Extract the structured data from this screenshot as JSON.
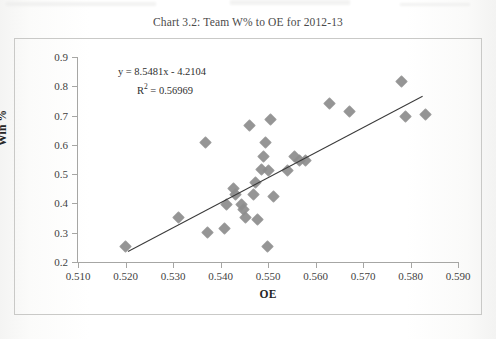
{
  "title": "Chart 3.2:  Team W% to OE for 2012-13",
  "annotation": {
    "equation": "y = 8.5481x - 4.2104",
    "r_squared_prefix": "R",
    "r_squared_exp": "2",
    "r_squared_value": " = 0.56969"
  },
  "colors": {
    "marker": "#8d8d8d",
    "trendline": "#3a3a3a",
    "axis": "#a6a6a4",
    "frame": "#c9c9c7",
    "text": "#3f3f3f"
  },
  "chart_data": {
    "type": "scatter",
    "title": "Chart 3.2:  Team W% to OE for 2012-13",
    "xlabel": "OE",
    "ylabel": "Win %",
    "xlim": [
      0.51,
      0.59
    ],
    "ylim": [
      0.2,
      0.9
    ],
    "xticks": [
      "0.510",
      "0.520",
      "0.530",
      "0.540",
      "0.550",
      "0.560",
      "0.570",
      "0.580",
      "0.590"
    ],
    "yticks": [
      "0.2",
      "0.3",
      "0.4",
      "0.5",
      "0.6",
      "0.7",
      "0.8",
      "0.9"
    ],
    "xtick_values": [
      0.51,
      0.52,
      0.53,
      0.54,
      0.55,
      0.56,
      0.57,
      0.58,
      0.59
    ],
    "ytick_values": [
      0.2,
      0.3,
      0.4,
      0.5,
      0.6,
      0.7,
      0.8,
      0.9
    ],
    "grid": false,
    "legend": false,
    "marker": "diamond",
    "annotations": [
      "y = 8.5481x - 4.2104",
      "R2 = 0.56969"
    ],
    "trendline": {
      "type": "linear",
      "slope": 8.5481,
      "intercept": -4.2104,
      "r_squared": 0.56969,
      "x_start": 0.5205,
      "x_end": 0.5825
    },
    "points": [
      {
        "x": 0.52,
        "y": 0.253
      },
      {
        "x": 0.5312,
        "y": 0.353
      },
      {
        "x": 0.5368,
        "y": 0.607
      },
      {
        "x": 0.5372,
        "y": 0.3
      },
      {
        "x": 0.5408,
        "y": 0.315
      },
      {
        "x": 0.5412,
        "y": 0.398
      },
      {
        "x": 0.5428,
        "y": 0.452
      },
      {
        "x": 0.5432,
        "y": 0.432
      },
      {
        "x": 0.5444,
        "y": 0.398
      },
      {
        "x": 0.5448,
        "y": 0.378
      },
      {
        "x": 0.5452,
        "y": 0.352
      },
      {
        "x": 0.5462,
        "y": 0.665
      },
      {
        "x": 0.547,
        "y": 0.432
      },
      {
        "x": 0.5474,
        "y": 0.472
      },
      {
        "x": 0.5478,
        "y": 0.345
      },
      {
        "x": 0.5486,
        "y": 0.515
      },
      {
        "x": 0.549,
        "y": 0.56
      },
      {
        "x": 0.5494,
        "y": 0.607
      },
      {
        "x": 0.5498,
        "y": 0.252
      },
      {
        "x": 0.5502,
        "y": 0.512
      },
      {
        "x": 0.5506,
        "y": 0.688
      },
      {
        "x": 0.5512,
        "y": 0.425
      },
      {
        "x": 0.554,
        "y": 0.512
      },
      {
        "x": 0.5556,
        "y": 0.56
      },
      {
        "x": 0.5566,
        "y": 0.548
      },
      {
        "x": 0.5578,
        "y": 0.545
      },
      {
        "x": 0.563,
        "y": 0.742
      },
      {
        "x": 0.5672,
        "y": 0.715
      },
      {
        "x": 0.5782,
        "y": 0.818
      },
      {
        "x": 0.579,
        "y": 0.697
      },
      {
        "x": 0.5832,
        "y": 0.705
      }
    ]
  }
}
